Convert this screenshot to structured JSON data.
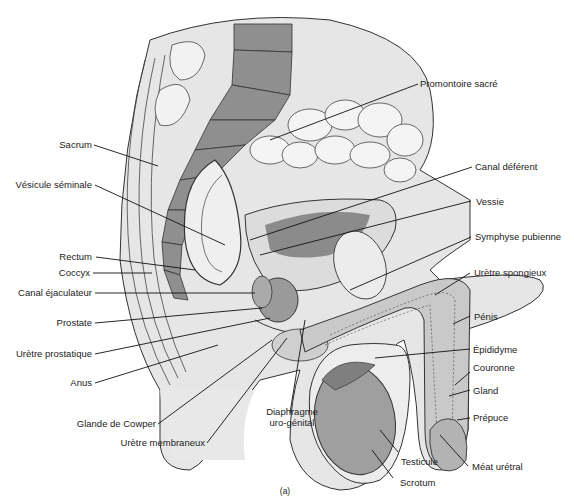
{
  "figure": {
    "caption": "(a)",
    "colors": {
      "bone": "#8f8f8f",
      "tissue": "#e6e6e6",
      "tissue_dark": "#bdbdbd",
      "outline": "#333333",
      "leader": "#111111",
      "background": "#ffffff"
    }
  },
  "labels": {
    "left": [
      {
        "id": "sacrum",
        "text": "Sacrum"
      },
      {
        "id": "vesicule-seminale",
        "text": "Vésicule séminale"
      },
      {
        "id": "rectum",
        "text": "Rectum"
      },
      {
        "id": "coccyx",
        "text": "Coccyx"
      },
      {
        "id": "canal-ejaculateur",
        "text": "Canal éjaculateur"
      },
      {
        "id": "prostate",
        "text": "Prostate"
      },
      {
        "id": "uretre-prostatique",
        "text": "Urètre prostatique"
      },
      {
        "id": "anus",
        "text": "Anus"
      },
      {
        "id": "glande-de-cowper",
        "text": "Glande de Cowper"
      },
      {
        "id": "uretre-membraneux",
        "text": "Urètre membraneux"
      }
    ],
    "bottom": [
      {
        "id": "diaphragme",
        "line1": "Diaphragme",
        "line2": "uro-génital"
      }
    ],
    "right": [
      {
        "id": "promontoire-sacre",
        "text": "Promontoire sacré"
      },
      {
        "id": "canal-deferent",
        "text": "Canal déférent"
      },
      {
        "id": "vessie",
        "text": "Vessie"
      },
      {
        "id": "symphyse-pubienne",
        "text": "Symphyse pubienne"
      },
      {
        "id": "uretre-spongieux",
        "text": "Urètre spongieux"
      },
      {
        "id": "penis",
        "text": "Pénis"
      },
      {
        "id": "epididyme",
        "text": "Épididyme"
      },
      {
        "id": "couronne",
        "text": "Couronne"
      },
      {
        "id": "gland",
        "text": "Gland"
      },
      {
        "id": "prepuce",
        "text": "Prépuce"
      },
      {
        "id": "meat-uretral",
        "text": "Méat urétral"
      },
      {
        "id": "testicule",
        "text": "Testicule"
      },
      {
        "id": "scrotum",
        "text": "Scrotum"
      }
    ]
  }
}
